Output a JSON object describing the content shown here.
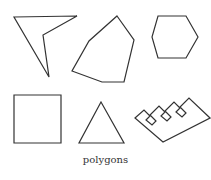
{
  "caption": "polygons",
  "stroke_color": "#333333",
  "shapes": [
    {
      "name": "concave-quadrilateral",
      "points": "14,17 77,16 43,35 49,77"
    },
    {
      "name": "irregular-heptagon",
      "points": "117,16 134,40 124,82 102,82 72,71 89,41"
    },
    {
      "name": "hexagon",
      "points": "158,16 186,16 198,37 186,58 158,58 152,37"
    },
    {
      "name": "square",
      "points": "14,95 61,95 61,143 14,143"
    },
    {
      "name": "triangle",
      "points": "101,102 124,143 79,143"
    },
    {
      "name": "comb",
      "points": "135,118 144,110 150,116 146,120 152,125 156,121 150,115 159,106 165,112 161,116 167,121 171,117 165,111 174,102 180,108 176,112 182,117 186,113 180,107 189,98 210,118 163,142"
    }
  ]
}
